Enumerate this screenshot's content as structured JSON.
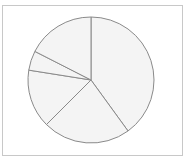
{
  "chart_data": {
    "type": "pie",
    "title": "",
    "labels": [
      "Slice A",
      "Slice B",
      "Slice C",
      "Slice D",
      "Slice E"
    ],
    "values": [
      40,
      22.5,
      15,
      5,
      17.5
    ],
    "start_angle_deg": 0,
    "direction": "clockwise",
    "legend": "none",
    "colors": {
      "fill": "#f4f4f4",
      "stroke": "#8a8a8a",
      "frame": "#c8c8c8"
    }
  }
}
